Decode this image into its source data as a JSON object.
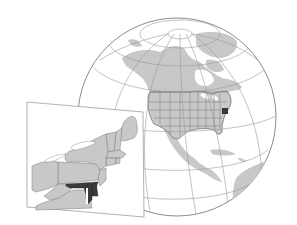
{
  "map": {
    "title": "Locator map of Maryland",
    "description": "Orthographic globe centered on North America with United States state boundaries, and an inset map of the northeastern United States with Maryland highlighted.",
    "highlighted_region": "Maryland",
    "globe": {
      "region_shown": "North America",
      "graticule": true,
      "center": [
        177,
        119
      ],
      "radius": 100
    },
    "inset": {
      "region_shown": "Northeastern United States",
      "states_visible": [
        "Maine",
        "New Hampshire",
        "Vermont",
        "Massachusetts",
        "Rhode Island",
        "Connecticut",
        "New York",
        "New Jersey",
        "Pennsylvania",
        "Delaware",
        "Maryland",
        "Ohio",
        "West Virginia",
        "Virginia"
      ],
      "water_bodies": [
        "Lake Erie",
        "Lake Ontario",
        "Chesapeake Bay"
      ]
    },
    "colors": {
      "background": "#ffffff",
      "land": "#c8c8c8",
      "state_border": "#7a7a7a",
      "highlight": "#3a3a3a",
      "graticule": "#9a9a9a",
      "globe_outline": "#8c8c8c",
      "inset_border": "#a0a0a0"
    }
  }
}
